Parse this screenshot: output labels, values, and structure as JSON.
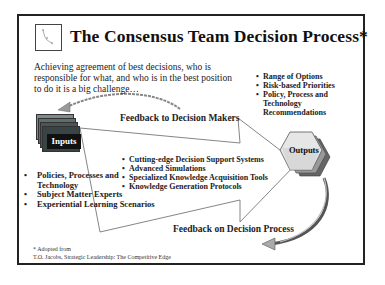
{
  "slide": {
    "title": "The Consensus Team Decision Process*",
    "logo_icon": "team-logo-icon",
    "intro_text": "Achieving agreement of best decisions, who is responsible for what, and who is in the best position to do it is a big challenge…",
    "feedback_top": "Feedback to Decision Makers",
    "feedback_bottom": "Feedback on Decision Process",
    "inputs": {
      "label": "Inputs",
      "items": [
        "Policies, Processes and Technology",
        "Subject Matter Experts",
        "Experiential Learning Scenarios"
      ]
    },
    "process": {
      "items": [
        "Cutting-edge Decision Support Systems",
        "Advanced Simulations",
        "Specialized Knowledge Acquisition  Tools",
        "Knowledge Generation Protocols"
      ]
    },
    "outputs": {
      "label": "Outputs",
      "items": [
        "Range of Options",
        "Risk-based  Priorities",
        "Policy, Process and Technology Recommendations"
      ]
    },
    "footnote": {
      "line1": "* Adopted from",
      "line2": "T.O. Jacobs, Strategic Leadership: The Competitive Edge"
    },
    "colors": {
      "border": "#222222",
      "inputs_box": "#111111",
      "card_dark": "#3a3a3a",
      "card_mid": "#6b7b7b",
      "hex_light": "#e8e8e8",
      "hex_shadow": "#8a8a8a"
    }
  }
}
